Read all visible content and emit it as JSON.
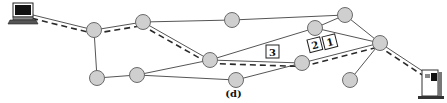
{
  "figure": {
    "caption": "(d)",
    "nodes": [
      {
        "id": "A",
        "x": 94,
        "y": 30
      },
      {
        "id": "B",
        "x": 143,
        "y": 22
      },
      {
        "id": "C",
        "x": 232,
        "y": 20
      },
      {
        "id": "D",
        "x": 315,
        "y": 28
      },
      {
        "id": "E",
        "x": 345,
        "y": 15
      },
      {
        "id": "F",
        "x": 380,
        "y": 43
      },
      {
        "id": "G",
        "x": 210,
        "y": 60
      },
      {
        "id": "H",
        "x": 302,
        "y": 63
      },
      {
        "id": "I",
        "x": 97,
        "y": 78
      },
      {
        "id": "J",
        "x": 137,
        "y": 75
      },
      {
        "id": "K",
        "x": 236,
        "y": 80
      },
      {
        "id": "L",
        "x": 350,
        "y": 80
      }
    ],
    "edges": [
      [
        "laptop",
        "A"
      ],
      [
        "A",
        "B"
      ],
      [
        "A",
        "I"
      ],
      [
        "I",
        "J"
      ],
      [
        "B",
        "C"
      ],
      [
        "C",
        "E"
      ],
      [
        "B",
        "G"
      ],
      [
        "J",
        "G"
      ],
      [
        "J",
        "K"
      ],
      [
        "G",
        "D"
      ],
      [
        "G",
        "H"
      ],
      [
        "D",
        "E"
      ],
      [
        "D",
        "F"
      ],
      [
        "E",
        "F"
      ],
      [
        "K",
        "H"
      ],
      [
        "H",
        "F"
      ],
      [
        "L",
        "F"
      ],
      [
        "F",
        "server"
      ]
    ],
    "route": [
      "laptop",
      "A",
      "B",
      "G",
      "H",
      "F",
      "server"
    ],
    "packets": [
      {
        "label": "3",
        "x": 266,
        "y": 45
      },
      {
        "label": "2",
        "x": 307,
        "y": 40
      },
      {
        "label": "1",
        "x": 322,
        "y": 37
      }
    ],
    "endpoints": {
      "source": "laptop-computer",
      "destination": "server-computer"
    }
  }
}
